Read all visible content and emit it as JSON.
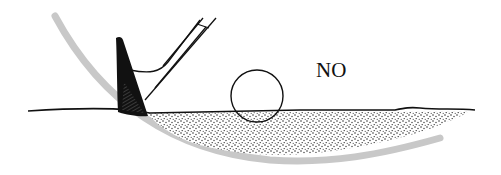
{
  "diagram": {
    "label": "NO",
    "elements": [
      "club-head",
      "club-shaft",
      "ball",
      "sand",
      "ground-line",
      "swing-arc"
    ],
    "colors": {
      "ink": "#111111",
      "swing_arc": "#c8c8c8",
      "background": "#ffffff"
    }
  }
}
